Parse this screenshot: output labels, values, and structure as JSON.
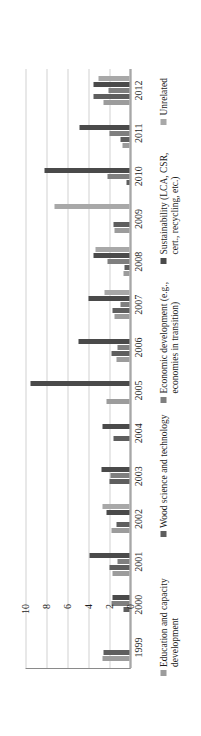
{
  "chart_data": {
    "type": "bar",
    "title": "",
    "xlabel": "",
    "ylabel": "",
    "ylim": [
      0,
      10
    ],
    "yticks": [
      0,
      2,
      4,
      6,
      8,
      10
    ],
    "grid": true,
    "orientation": "rotated-90-ccw",
    "legend_position": "bottom",
    "categories": [
      "1999",
      "2000",
      "2001",
      "2002",
      "2003",
      "2004",
      "2005",
      "2006",
      "2007",
      "2008",
      "2009",
      "2010",
      "2011",
      "2012"
    ],
    "series": [
      {
        "name": "Education and capacity development",
        "color": "#9c9c9c",
        "values": [
          2.6,
          0.0,
          1.6,
          1.7,
          0.0,
          0.0,
          2.2,
          1.2,
          1.4,
          0.6,
          1.4,
          0.0,
          0.7,
          2.5
        ]
      },
      {
        "name": "Wood science and technology",
        "color": "#5e5e5e",
        "values": [
          2.5,
          0.6,
          1.9,
          1.2,
          1.9,
          1.5,
          0.0,
          1.7,
          1.6,
          0.5,
          1.5,
          0.3,
          0.9,
          3.4
        ]
      },
      {
        "name": "Economic development (e.g., economies in transition)",
        "color": "#7f7f7f",
        "values": [
          0.0,
          1.7,
          1.1,
          0.0,
          1.8,
          0.0,
          0.0,
          1.1,
          0.9,
          2.1,
          0.0,
          2.1,
          1.9,
          2.0
        ]
      },
      {
        "name": "Sustainability (LCA, CSR, cert., recycling, etc.)",
        "color": "#4a4a4a",
        "values": [
          0.0,
          1.6,
          3.8,
          2.2,
          2.7,
          2.6,
          9.4,
          4.9,
          3.9,
          3.4,
          0.0,
          8.1,
          4.8,
          3.4
        ]
      },
      {
        "name": "Unrelated",
        "color": "#a8a8a8",
        "values": [
          0.0,
          0.0,
          0.0,
          2.6,
          0.0,
          0.0,
          0.0,
          0.0,
          2.4,
          3.2,
          7.1,
          0.0,
          0.0,
          3.0
        ]
      }
    ]
  },
  "axis": {
    "y_tick_labels": [
      "10",
      "8",
      "6",
      "4",
      "2",
      "0"
    ]
  },
  "legend": {
    "items": [
      {
        "label": "Education and capacity development",
        "color": "#9c9c9c"
      },
      {
        "label": "Wood science and technology",
        "color": "#5e5e5e"
      },
      {
        "label": "Economic development (e.g., economies in transition)",
        "color": "#7f7f7f"
      },
      {
        "label": "Sustainability (LCA, CSR, cert., recycling, etc.)",
        "color": "#4a4a4a"
      },
      {
        "label": "Unrelated",
        "color": "#a8a8a8"
      }
    ]
  }
}
